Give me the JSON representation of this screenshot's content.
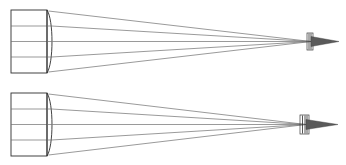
{
  "figure": {
    "background_color": "#ffffff",
    "width": 346,
    "height": 165,
    "line_color": "#6e6e6e",
    "outline_color": "#2e2e2e",
    "focus_color": "#5a5a5a"
  },
  "chart_data": {
    "type": "line",
    "xlabel": "",
    "ylabel": "",
    "xlim": [
      0,
      346
    ],
    "ylim": [
      0,
      165
    ],
    "grid": false,
    "legend": "none",
    "annotations": [],
    "panels": [
      {
        "name": "upper-ray-trace",
        "axis_y": 41.5,
        "lens": {
          "name": "plano-convex-lens",
          "flat_face_x": 47,
          "top_y": 10,
          "bottom_y": 73,
          "curve_bulge_x": 52,
          "aperture_block_left_x": 11
        },
        "incoming_rays_y": [
          10,
          26,
          41.5,
          57,
          73
        ],
        "focus_point": {
          "x": 311,
          "y": 41.5
        },
        "detector": {
          "name": "focal-aperture",
          "x": 307,
          "width": 6,
          "top_y": 33,
          "bottom_y": 50,
          "bar_count": 3
        },
        "wedge": {
          "tip_x": 339,
          "base_x": 311,
          "half_height": 5
        }
      },
      {
        "name": "lower-ray-trace",
        "axis_y": 124.5,
        "lens": {
          "name": "plano-convex-lens",
          "flat_face_x": 47,
          "top_y": 93,
          "bottom_y": 156,
          "curve_bulge_x": 52,
          "aperture_block_left_x": 11
        },
        "incoming_rays_y": [
          93,
          109,
          124.5,
          140,
          156
        ],
        "focus_point": {
          "x": 306,
          "y": 124.5
        },
        "detector": {
          "name": "focal-aperture",
          "x": 300,
          "width": 9,
          "top_y": 115,
          "bottom_y": 134,
          "bar_count": 4
        },
        "wedge": {
          "tip_x": 338,
          "base_x": 306,
          "half_height": 5
        }
      }
    ],
    "series": [
      {
        "name": "upper-marginal-ray-top",
        "x": [
          11,
          47,
          52,
          311
        ],
        "y": [
          10,
          10,
          11,
          41.5
        ]
      },
      {
        "name": "upper-intermediate-ray-top",
        "x": [
          11,
          47,
          51,
          311
        ],
        "y": [
          26,
          26,
          26,
          41.5
        ]
      },
      {
        "name": "upper-optical-axis",
        "x": [
          11,
          47,
          52,
          311
        ],
        "y": [
          41.5,
          41.5,
          41.5,
          41.5
        ]
      },
      {
        "name": "upper-intermediate-ray-bottom",
        "x": [
          11,
          47,
          51,
          311
        ],
        "y": [
          57,
          57,
          57,
          41.5
        ]
      },
      {
        "name": "upper-marginal-ray-bottom",
        "x": [
          11,
          47,
          52,
          311
        ],
        "y": [
          73,
          73,
          72,
          41.5
        ]
      },
      {
        "name": "lower-marginal-ray-top",
        "x": [
          11,
          47,
          52,
          306
        ],
        "y": [
          93,
          93,
          94,
          124.5
        ]
      },
      {
        "name": "lower-intermediate-ray-top",
        "x": [
          11,
          47,
          51,
          306
        ],
        "y": [
          109,
          109,
          109,
          124.5
        ]
      },
      {
        "name": "lower-optical-axis",
        "x": [
          11,
          47,
          52,
          306
        ],
        "y": [
          124.5,
          124.5,
          124.5,
          124.5
        ]
      },
      {
        "name": "lower-intermediate-ray-bottom",
        "x": [
          11,
          47,
          51,
          306
        ],
        "y": [
          140,
          140,
          140,
          124.5
        ]
      },
      {
        "name": "lower-marginal-ray-bottom",
        "x": [
          11,
          47,
          52,
          306
        ],
        "y": [
          156,
          156,
          155,
          124.5
        ]
      }
    ]
  }
}
